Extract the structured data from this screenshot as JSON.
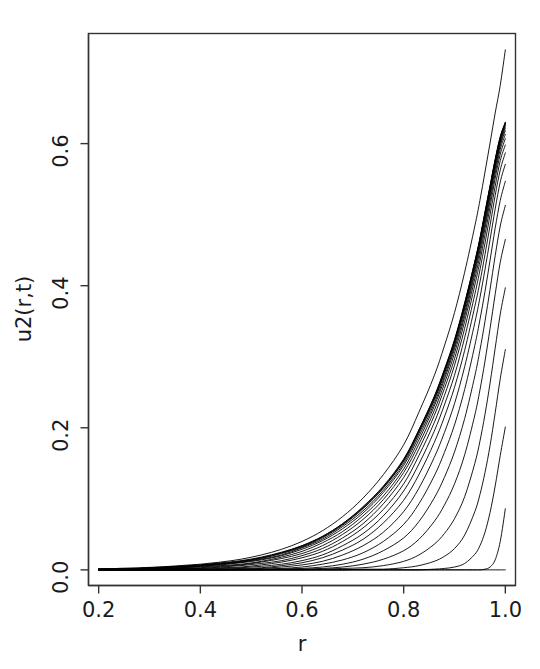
{
  "chart_data": {
    "type": "line",
    "title": "",
    "subtitle": "",
    "xlabel": "r",
    "ylabel": "u2(r,t)",
    "xlim": [
      0.18,
      1.02
    ],
    "ylim": [
      -0.022,
      0.755
    ],
    "xticks": [
      0.2,
      0.4,
      0.6,
      0.8,
      1.0
    ],
    "xtick_labels": [
      "0.2",
      "0.4",
      "0.6",
      "0.8",
      "1.0"
    ],
    "yticks": [
      0.0,
      0.2,
      0.4,
      0.6
    ],
    "ytick_labels": [
      "0.0",
      "0.2",
      "0.4",
      "0.6"
    ],
    "grid": false,
    "legend": "none",
    "box": true,
    "line_color": "#000000",
    "line_width": 0.9,
    "n_series": 22,
    "x": [
      0.2,
      0.24,
      0.28,
      0.32,
      0.36,
      0.4,
      0.44,
      0.48,
      0.52,
      0.56,
      0.6,
      0.64,
      0.68,
      0.72,
      0.76,
      0.8,
      0.83,
      0.86,
      0.88,
      0.9,
      0.92,
      0.94,
      0.95,
      0.96,
      0.97,
      0.98,
      0.99,
      1.0
    ],
    "series": [
      {
        "name": "t=0.00",
        "values": [
          0,
          0,
          0,
          0,
          0,
          0,
          0,
          0,
          0,
          0,
          0,
          0,
          0,
          0,
          0,
          0,
          0,
          0,
          0,
          0,
          0,
          0,
          0,
          0,
          0,
          0,
          0,
          0
        ]
      },
      {
        "name": "t=0.05",
        "values": [
          0,
          0,
          0,
          0,
          0,
          0,
          0,
          0,
          0,
          0,
          0,
          0,
          0,
          0,
          0,
          0,
          0,
          0,
          0,
          0,
          0,
          0,
          0,
          0.001,
          0.004,
          0.014,
          0.04,
          0.086
        ]
      },
      {
        "name": "t=0.10",
        "values": [
          0,
          0,
          0,
          0,
          0,
          0,
          0,
          0,
          0,
          0,
          0,
          0,
          0,
          0,
          0,
          0,
          0,
          0.001,
          0.002,
          0.004,
          0.009,
          0.022,
          0.034,
          0.053,
          0.081,
          0.118,
          0.161,
          0.201
        ]
      },
      {
        "name": "t=0.15",
        "values": [
          0,
          0,
          0,
          0,
          0,
          0,
          0,
          0,
          0,
          0,
          0,
          0,
          0,
          0.001,
          0.001,
          0.003,
          0.006,
          0.012,
          0.019,
          0.03,
          0.049,
          0.082,
          0.106,
          0.137,
          0.175,
          0.221,
          0.269,
          0.31
        ]
      },
      {
        "name": "t=0.20",
        "values": [
          0,
          0,
          0,
          0,
          0,
          0,
          0,
          0,
          0,
          0,
          0,
          0.001,
          0.002,
          0.003,
          0.006,
          0.012,
          0.021,
          0.036,
          0.051,
          0.072,
          0.103,
          0.15,
          0.181,
          0.219,
          0.263,
          0.312,
          0.36,
          0.397
        ]
      },
      {
        "name": "t=0.25",
        "values": [
          0,
          0,
          0,
          0,
          0,
          0,
          0,
          0,
          0,
          0.001,
          0.001,
          0.002,
          0.004,
          0.008,
          0.015,
          0.027,
          0.043,
          0.068,
          0.091,
          0.121,
          0.162,
          0.218,
          0.253,
          0.294,
          0.34,
          0.388,
          0.433,
          0.465
        ]
      },
      {
        "name": "t=0.30",
        "values": [
          0,
          0,
          0,
          0,
          0,
          0,
          0,
          0,
          0.001,
          0.001,
          0.002,
          0.004,
          0.008,
          0.015,
          0.027,
          0.045,
          0.068,
          0.101,
          0.13,
          0.166,
          0.213,
          0.273,
          0.309,
          0.35,
          0.395,
          0.442,
          0.484,
          0.513
        ]
      },
      {
        "name": "t=0.35",
        "values": [
          0,
          0,
          0,
          0,
          0,
          0,
          0,
          0.001,
          0.001,
          0.002,
          0.004,
          0.008,
          0.014,
          0.024,
          0.04,
          0.064,
          0.093,
          0.132,
          0.165,
          0.204,
          0.254,
          0.316,
          0.352,
          0.392,
          0.436,
          0.481,
          0.52,
          0.547
        ]
      },
      {
        "name": "t=0.40",
        "values": [
          0,
          0,
          0,
          0,
          0,
          0,
          0.001,
          0.001,
          0.002,
          0.004,
          0.007,
          0.012,
          0.021,
          0.034,
          0.053,
          0.082,
          0.115,
          0.158,
          0.193,
          0.234,
          0.286,
          0.348,
          0.383,
          0.423,
          0.465,
          0.508,
          0.546,
          0.571
        ]
      },
      {
        "name": "t=0.45",
        "values": [
          0,
          0,
          0,
          0,
          0,
          0.001,
          0.001,
          0.002,
          0.003,
          0.006,
          0.01,
          0.017,
          0.028,
          0.043,
          0.066,
          0.098,
          0.134,
          0.179,
          0.215,
          0.257,
          0.309,
          0.371,
          0.405,
          0.444,
          0.485,
          0.527,
          0.563,
          0.587
        ]
      },
      {
        "name": "t=0.50",
        "values": [
          0,
          0,
          0,
          0,
          0.001,
          0.001,
          0.002,
          0.003,
          0.005,
          0.008,
          0.013,
          0.021,
          0.034,
          0.051,
          0.076,
          0.111,
          0.149,
          0.195,
          0.232,
          0.274,
          0.327,
          0.388,
          0.422,
          0.46,
          0.5,
          0.54,
          0.576,
          0.598
        ]
      },
      {
        "name": "t=0.55",
        "values": [
          0,
          0,
          0,
          0.001,
          0.001,
          0.002,
          0.003,
          0.004,
          0.007,
          0.011,
          0.017,
          0.026,
          0.04,
          0.059,
          0.085,
          0.121,
          0.161,
          0.207,
          0.245,
          0.288,
          0.34,
          0.401,
          0.434,
          0.472,
          0.511,
          0.551,
          0.585,
          0.607
        ]
      },
      {
        "name": "t=0.60",
        "values": [
          0,
          0,
          0.001,
          0.001,
          0.002,
          0.002,
          0.004,
          0.006,
          0.009,
          0.013,
          0.02,
          0.03,
          0.045,
          0.065,
          0.093,
          0.13,
          0.17,
          0.217,
          0.255,
          0.297,
          0.35,
          0.41,
          0.443,
          0.481,
          0.519,
          0.558,
          0.592,
          0.613
        ]
      },
      {
        "name": "t=0.65",
        "values": [
          0,
          0.001,
          0.001,
          0.002,
          0.002,
          0.003,
          0.005,
          0.007,
          0.011,
          0.016,
          0.023,
          0.034,
          0.05,
          0.071,
          0.099,
          0.137,
          0.177,
          0.224,
          0.262,
          0.305,
          0.357,
          0.417,
          0.45,
          0.487,
          0.525,
          0.564,
          0.597,
          0.618
        ]
      },
      {
        "name": "t=0.70",
        "values": [
          0.001,
          0.001,
          0.001,
          0.002,
          0.003,
          0.004,
          0.006,
          0.008,
          0.012,
          0.018,
          0.026,
          0.038,
          0.054,
          0.076,
          0.104,
          0.142,
          0.183,
          0.23,
          0.268,
          0.311,
          0.362,
          0.422,
          0.455,
          0.492,
          0.53,
          0.568,
          0.6,
          0.622
        ]
      },
      {
        "name": "t=0.75",
        "values": [
          0.001,
          0.001,
          0.002,
          0.002,
          0.003,
          0.005,
          0.007,
          0.01,
          0.014,
          0.02,
          0.029,
          0.041,
          0.058,
          0.08,
          0.109,
          0.147,
          0.188,
          0.234,
          0.272,
          0.315,
          0.367,
          0.426,
          0.459,
          0.496,
          0.533,
          0.571,
          0.603,
          0.625
        ]
      },
      {
        "name": "t=0.80",
        "values": [
          0.001,
          0.001,
          0.002,
          0.003,
          0.004,
          0.005,
          0.008,
          0.011,
          0.015,
          0.021,
          0.031,
          0.043,
          0.061,
          0.083,
          0.112,
          0.15,
          0.192,
          0.238,
          0.276,
          0.318,
          0.37,
          0.429,
          0.462,
          0.499,
          0.536,
          0.573,
          0.605,
          0.627
        ]
      },
      {
        "name": "t=0.85",
        "values": [
          0.001,
          0.001,
          0.002,
          0.003,
          0.004,
          0.006,
          0.008,
          0.011,
          0.016,
          0.023,
          0.032,
          0.045,
          0.063,
          0.086,
          0.115,
          0.153,
          0.194,
          0.24,
          0.278,
          0.321,
          0.372,
          0.431,
          0.464,
          0.501,
          0.538,
          0.575,
          0.607,
          0.628
        ]
      },
      {
        "name": "t=0.90",
        "values": [
          0.001,
          0.001,
          0.002,
          0.003,
          0.005,
          0.006,
          0.009,
          0.012,
          0.017,
          0.024,
          0.033,
          0.046,
          0.064,
          0.087,
          0.116,
          0.154,
          0.196,
          0.242,
          0.28,
          0.322,
          0.374,
          0.433,
          0.465,
          0.502,
          0.539,
          0.576,
          0.608,
          0.629
        ]
      },
      {
        "name": "t=0.95",
        "values": [
          0.001,
          0.002,
          0.002,
          0.003,
          0.005,
          0.007,
          0.009,
          0.012,
          0.017,
          0.024,
          0.034,
          0.047,
          0.065,
          0.088,
          0.117,
          0.155,
          0.197,
          0.243,
          0.281,
          0.323,
          0.375,
          0.434,
          0.466,
          0.503,
          0.54,
          0.577,
          0.609,
          0.63
        ]
      },
      {
        "name": "t=1.00",
        "values": [
          0.001,
          0.002,
          0.002,
          0.004,
          0.005,
          0.007,
          0.01,
          0.013,
          0.018,
          0.025,
          0.034,
          0.047,
          0.065,
          0.089,
          0.118,
          0.156,
          0.197,
          0.244,
          0.282,
          0.324,
          0.376,
          0.434,
          0.467,
          0.504,
          0.541,
          0.578,
          0.61,
          0.63
        ]
      },
      {
        "name": "t=asymptotic",
        "values": [
          0.001,
          0.002,
          0.003,
          0.004,
          0.006,
          0.008,
          0.011,
          0.015,
          0.021,
          0.029,
          0.04,
          0.055,
          0.075,
          0.101,
          0.134,
          0.176,
          0.222,
          0.273,
          0.315,
          0.362,
          0.419,
          0.484,
          0.52,
          0.56,
          0.601,
          0.643,
          0.682,
          0.732
        ]
      }
    ]
  },
  "axis": {
    "x_title": "r",
    "y_title": "u2(r,t)"
  }
}
